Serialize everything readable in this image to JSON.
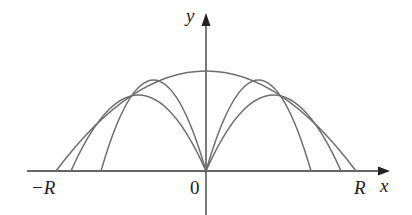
{
  "figure": {
    "type": "diagram",
    "axes": {
      "x_label": "x",
      "y_label": "y",
      "origin_label": "0",
      "left_limit_label": "−R",
      "right_limit_label": "R"
    },
    "colors": {
      "axis": "#333333",
      "curve": "#6e6e6e",
      "background": "#ffffff",
      "text": "#222222"
    },
    "curves": {
      "envelope": {
        "from": "-R",
        "to": "R",
        "apex_x": 0
      },
      "trajectories": [
        {
          "side": "left",
          "landing": "outer"
        },
        {
          "side": "left",
          "landing": "inner"
        },
        {
          "side": "right",
          "landing": "inner"
        },
        {
          "side": "right",
          "landing": "outer"
        }
      ]
    }
  }
}
